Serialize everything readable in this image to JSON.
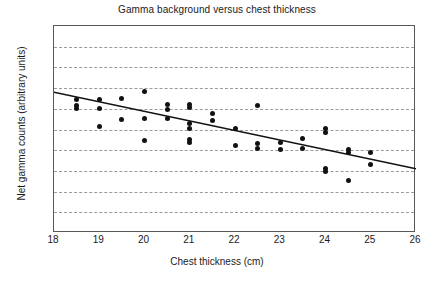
{
  "chart_data": {
    "type": "scatter",
    "title": "Gamma background versus chest thickness",
    "xlabel": "Chest thickness (cm)",
    "ylabel": "Net gamma counts (arbitrary units)",
    "xlim": [
      18,
      26
    ],
    "ylim": [
      50,
      150
    ],
    "xticks": [
      18,
      19,
      20,
      21,
      22,
      23,
      24,
      25,
      26
    ],
    "yticks": [
      50,
      60,
      70,
      80,
      90,
      100,
      110,
      120,
      130,
      140,
      150
    ],
    "grid": "horizontal-dashed",
    "legend": "none",
    "marker_color": "#111111",
    "trendline_color": "#111111",
    "points": [
      {
        "x": 18.5,
        "y": 114.5
      },
      {
        "x": 18.5,
        "y": 111.5
      },
      {
        "x": 18.5,
        "y": 110.0
      },
      {
        "x": 19.0,
        "y": 114.5
      },
      {
        "x": 19.0,
        "y": 110.0
      },
      {
        "x": 19.0,
        "y": 101.5
      },
      {
        "x": 19.5,
        "y": 115.0
      },
      {
        "x": 19.5,
        "y": 105.0
      },
      {
        "x": 20.0,
        "y": 118.5
      },
      {
        "x": 20.0,
        "y": 105.5
      },
      {
        "x": 20.0,
        "y": 94.5
      },
      {
        "x": 20.5,
        "y": 112.0
      },
      {
        "x": 20.5,
        "y": 109.5
      },
      {
        "x": 20.5,
        "y": 105.5
      },
      {
        "x": 21.0,
        "y": 112.0
      },
      {
        "x": 21.0,
        "y": 110.5
      },
      {
        "x": 21.0,
        "y": 103.0
      },
      {
        "x": 21.0,
        "y": 100.5
      },
      {
        "x": 21.0,
        "y": 95.0
      },
      {
        "x": 21.0,
        "y": 93.5
      },
      {
        "x": 21.5,
        "y": 107.5
      },
      {
        "x": 21.5,
        "y": 104.5
      },
      {
        "x": 22.0,
        "y": 100.5
      },
      {
        "x": 22.0,
        "y": 92.5
      },
      {
        "x": 22.5,
        "y": 111.5
      },
      {
        "x": 22.5,
        "y": 93.0
      },
      {
        "x": 22.5,
        "y": 91.0
      },
      {
        "x": 23.0,
        "y": 93.5
      },
      {
        "x": 23.0,
        "y": 90.5
      },
      {
        "x": 23.5,
        "y": 95.5
      },
      {
        "x": 23.5,
        "y": 91.0
      },
      {
        "x": 24.0,
        "y": 100.5
      },
      {
        "x": 24.0,
        "y": 98.5
      },
      {
        "x": 24.0,
        "y": 81.0
      },
      {
        "x": 24.0,
        "y": 79.5
      },
      {
        "x": 24.5,
        "y": 90.5
      },
      {
        "x": 24.5,
        "y": 89.0
      },
      {
        "x": 24.5,
        "y": 75.5
      },
      {
        "x": 25.0,
        "y": 89.0
      },
      {
        "x": 25.0,
        "y": 83.0
      }
    ],
    "trendline": {
      "x0": 18,
      "y0": 118,
      "x1": 26,
      "y1": 81
    }
  }
}
